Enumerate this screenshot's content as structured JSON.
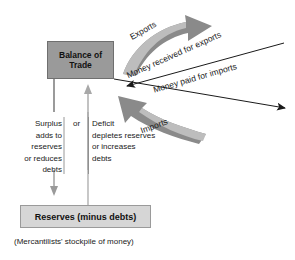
{
  "diagram": {
    "colors": {
      "balance_box_fill": "#9a9a9a",
      "reserves_box_fill": "#d6d6d6",
      "thick_arrow_gray": "#7e7e7e",
      "thick_arrow_light_gray": "#b3b3b3",
      "thin_arrow_black": "#1a1a1a",
      "divider_line": "#8c8c8c",
      "background": "#ffffff"
    },
    "nodes": {
      "balance_of_trade": "Balance\nof\nTrade",
      "reserves": "Reserves (minus debts)"
    },
    "caption": "(Mercantilists' stockpile of money)",
    "arrow_labels": {
      "exports": "Exports",
      "money_received_for_exports": "Money received for exports",
      "money_paid_for_imports": "Money paid for imports",
      "imports": "Imports"
    },
    "branches": {
      "surplus": "Surplus\nadds to\nreserves\nor reduces\ndebts",
      "connector": "or",
      "deficit": "Deficit\ndepletes reserves\nor increases\ndebts"
    }
  }
}
